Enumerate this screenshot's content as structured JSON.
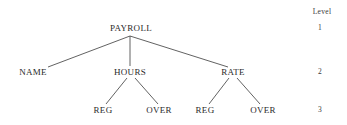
{
  "diagram": {
    "type": "tree",
    "root": {
      "label": "PAYROLL",
      "level": 1,
      "children": [
        {
          "label": "NAME",
          "level": 2,
          "children": []
        },
        {
          "label": "HOURS",
          "level": 2,
          "children": [
            {
              "label": "REG",
              "level": 3
            },
            {
              "label": "OVER",
              "level": 3
            }
          ]
        },
        {
          "label": "RATE",
          "level": 2,
          "children": [
            {
              "label": "REG",
              "level": 3
            },
            {
              "label": "OVER",
              "level": 3
            }
          ]
        }
      ]
    },
    "nodes": {
      "payroll": "PAYROLL",
      "name": "NAME",
      "hours": "HOURS",
      "rate": "RATE",
      "hours_reg": "REG",
      "hours_over": "OVER",
      "rate_reg": "REG",
      "rate_over": "OVER"
    },
    "level_column": {
      "header": "Level",
      "levels": [
        "1",
        "2",
        "3"
      ]
    },
    "line_color": "#3a3a3a"
  }
}
